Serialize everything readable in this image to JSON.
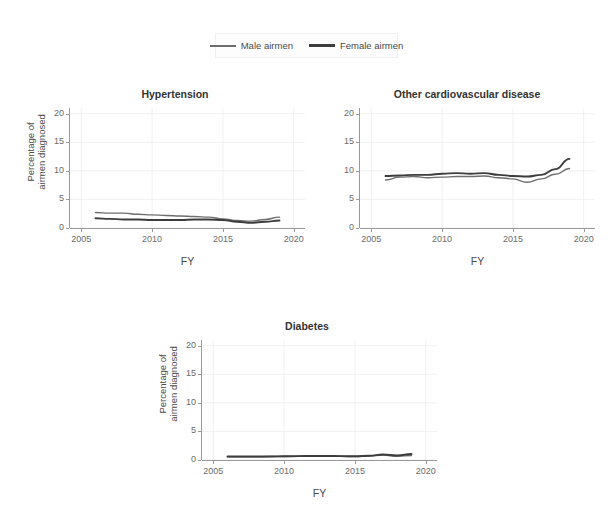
{
  "figure": {
    "background": "#ffffff",
    "series_colors": {
      "male": "#6e6e6e",
      "female": "#3d3d3d"
    }
  },
  "legend": {
    "entries": [
      {
        "label": "Male airmen",
        "key": "male-line-key"
      },
      {
        "label": "Female airmen",
        "key": "female-line-key"
      }
    ]
  },
  "axis": {
    "xlabel": "FY",
    "ylabel": "Percentage of\nairmen diagnosed",
    "xticks": [
      "2005",
      "2010",
      "2015",
      "2020"
    ],
    "yticks": [
      "0",
      "5",
      "10",
      "15",
      "20"
    ]
  },
  "footer": {
    "ghost_text": ""
  },
  "chart_data": [
    {
      "type": "line",
      "title": "Hypertension",
      "xlabel": "FY",
      "ylabel": "Percentage of airmen diagnosed",
      "xlim": [
        2004.2,
        2020.8
      ],
      "ylim": [
        0,
        21
      ],
      "xticks": [
        2005,
        2010,
        2015,
        2020
      ],
      "yticks": [
        0,
        5,
        10,
        15,
        20
      ],
      "grid": true,
      "legend_position": "top",
      "x": [
        2006,
        2007,
        2008,
        2009,
        2010,
        2011,
        2012,
        2013,
        2014,
        2015,
        2016,
        2017,
        2018,
        2019
      ],
      "series": [
        {
          "name": "Male airmen",
          "values": [
            2.7,
            2.6,
            2.6,
            2.4,
            2.3,
            2.2,
            2.1,
            2.0,
            1.9,
            1.6,
            1.3,
            1.2,
            1.5,
            1.9
          ]
        },
        {
          "name": "Female airmen",
          "values": [
            1.7,
            1.6,
            1.5,
            1.5,
            1.4,
            1.4,
            1.4,
            1.5,
            1.5,
            1.4,
            1.1,
            0.9,
            1.1,
            1.3
          ]
        }
      ]
    },
    {
      "type": "line",
      "title": "Other cardiovascular disease",
      "xlabel": "FY",
      "ylabel": "Percentage of airmen diagnosed",
      "xlim": [
        2004.2,
        2020.8
      ],
      "ylim": [
        0,
        21
      ],
      "xticks": [
        2005,
        2010,
        2015,
        2020
      ],
      "yticks": [
        0,
        5,
        10,
        15,
        20
      ],
      "grid": true,
      "legend_position": "top",
      "x": [
        2006,
        2007,
        2008,
        2009,
        2010,
        2011,
        2012,
        2013,
        2014,
        2015,
        2016,
        2017,
        2018,
        2019
      ],
      "series": [
        {
          "name": "Male airmen",
          "values": [
            8.4,
            8.9,
            9.0,
            8.8,
            8.9,
            9.0,
            9.0,
            9.1,
            8.8,
            8.6,
            8.0,
            8.6,
            9.4,
            10.4
          ]
        },
        {
          "name": "Female airmen",
          "values": [
            9.1,
            9.2,
            9.3,
            9.3,
            9.5,
            9.6,
            9.5,
            9.6,
            9.3,
            9.1,
            9.0,
            9.3,
            10.3,
            12.1
          ]
        }
      ]
    },
    {
      "type": "line",
      "title": "Diabetes",
      "xlabel": "FY",
      "ylabel": "Percentage of airmen diagnosed",
      "xlim": [
        2004.2,
        2020.8
      ],
      "ylim": [
        0,
        21
      ],
      "xticks": [
        2005,
        2010,
        2015,
        2020
      ],
      "yticks": [
        0,
        5,
        10,
        15,
        20
      ],
      "grid": true,
      "legend_position": "top",
      "x": [
        2006,
        2007,
        2008,
        2009,
        2010,
        2011,
        2012,
        2013,
        2014,
        2015,
        2016,
        2017,
        2018,
        2019
      ],
      "series": [
        {
          "name": "Male airmen",
          "values": [
            0.55,
            0.55,
            0.55,
            0.6,
            0.62,
            0.65,
            0.65,
            0.68,
            0.65,
            0.6,
            0.7,
            0.85,
            0.65,
            0.8
          ]
        },
        {
          "name": "Female airmen",
          "values": [
            0.6,
            0.6,
            0.6,
            0.62,
            0.65,
            0.68,
            0.7,
            0.7,
            0.68,
            0.65,
            0.75,
            0.95,
            0.8,
            1.05
          ]
        }
      ]
    }
  ]
}
